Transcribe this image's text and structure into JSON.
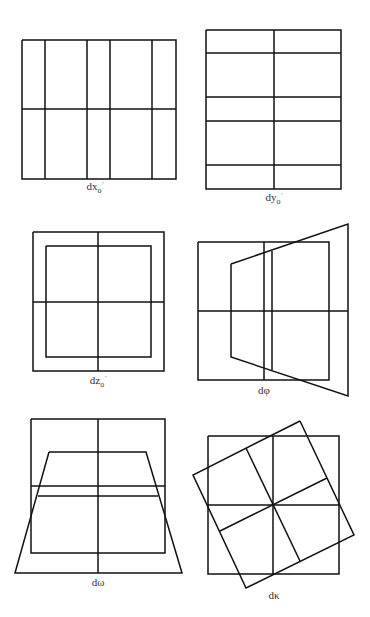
{
  "figure": {
    "stroke_color": "#111111",
    "stroke_width": 1.5,
    "background": "#ffffff",
    "label_color": "#333333"
  },
  "panels": [
    {
      "id": "dx",
      "label": {
        "base": "dx",
        "sub": "o",
        "sup": "'",
        "x": 95,
        "y": 181
      },
      "polylines": [
        {
          "points": "22,40 176,40 176,179 22,179 22,40",
          "closed": true
        },
        {
          "points": "45,40 45,179"
        },
        {
          "points": "87,40 87,179"
        },
        {
          "points": "110,40 110,179"
        },
        {
          "points": "152,40 152,179"
        },
        {
          "points": "22,109 176,109"
        }
      ]
    },
    {
      "id": "dy",
      "label": {
        "base": "dy",
        "sub": "o",
        "sup": "'",
        "x": 274,
        "y": 192
      },
      "polylines": [
        {
          "points": "206,30 341,30 341,189 206,189 206,30",
          "closed": true
        },
        {
          "points": "274,30 274,189"
        },
        {
          "points": "206,53 341,53"
        },
        {
          "points": "206,97 341,97"
        },
        {
          "points": "206,121 341,121"
        },
        {
          "points": "206,165 341,165"
        }
      ]
    },
    {
      "id": "dz",
      "label": {
        "base": "dz",
        "sub": "o",
        "sup": "'",
        "x": 98,
        "y": 375
      },
      "polylines": [
        {
          "points": "33,232 164,232 164,371 33,371 33,232",
          "closed": true
        },
        {
          "points": "46,246 151,246 151,357 46,357 46,246",
          "closed": true
        },
        {
          "points": "98,232 98,371"
        },
        {
          "points": "33,302 164,302"
        }
      ]
    },
    {
      "id": "dphi",
      "label": {
        "base": "dφ",
        "sub": "",
        "sup": "",
        "x": 264,
        "y": 385
      },
      "polylines": [
        {
          "points": "198,242 329,242 329,380 198,380 198,242",
          "closed": true
        },
        {
          "points": "264,242 264,380"
        },
        {
          "points": "198,311 348,311"
        },
        {
          "points": "231,264 348,224 348,396 231,357 231,264",
          "closed": true
        },
        {
          "points": "272,251 272,370"
        }
      ]
    },
    {
      "id": "domega",
      "label": {
        "base": "dω",
        "sub": "",
        "sup": "",
        "x": 98,
        "y": 577
      },
      "polylines": [
        {
          "points": "31,419 165,419 165,553 31,553 31,419",
          "closed": true
        },
        {
          "points": "98,419 98,573"
        },
        {
          "points": "31,486 165,486"
        },
        {
          "points": "49,452 146,452 182,573 15,573 49,452",
          "closed": true
        },
        {
          "points": "38,496 158,496"
        }
      ]
    },
    {
      "id": "dkappa",
      "label": {
        "base": "dκ",
        "sub": "",
        "sup": "",
        "x": 274,
        "y": 590
      },
      "polylines": [
        {
          "points": "208,436 339,436 339,574 208,574 208,436",
          "closed": true
        },
        {
          "points": "273,436 273,574"
        },
        {
          "points": "208,505 339,505"
        },
        {
          "points": "300,421 354,535 246,588 193,475 300,421",
          "closed": true
        },
        {
          "points": "246,448 300,561"
        },
        {
          "points": "220,531 327,478"
        }
      ]
    }
  ]
}
